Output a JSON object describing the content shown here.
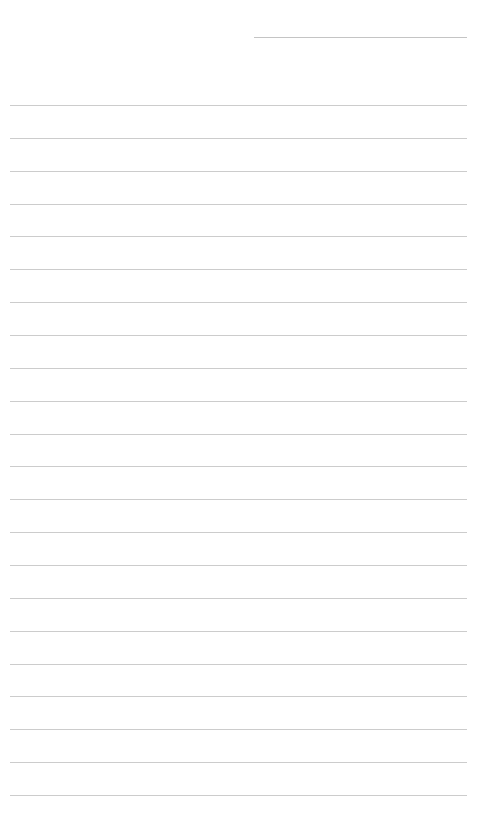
{
  "page": {
    "type": "lined-paper",
    "background_color": "#ffffff",
    "line_color": "#cccccc",
    "header_line": {
      "x": 254,
      "y": 37,
      "width": 213
    },
    "rules": {
      "count": 22,
      "x": 10,
      "width": 457,
      "first_y": 105,
      "spacing": 32.86
    }
  }
}
